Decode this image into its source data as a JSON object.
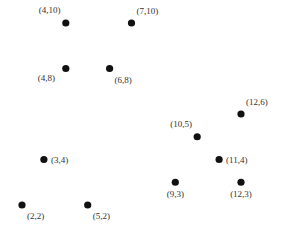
{
  "chart_data": {
    "type": "scatter",
    "title": "",
    "xlabel": "",
    "ylabel": "",
    "axes_visible": false,
    "grid": false,
    "legend": "none",
    "xlim": [
      2,
      12
    ],
    "ylim": [
      2,
      10
    ],
    "marker_color": "#111111",
    "points": [
      {
        "x": 4,
        "y": 10,
        "label": "(4,10)",
        "label_pos": "above-left"
      },
      {
        "x": 7,
        "y": 10,
        "label": "(7,10)",
        "label_pos": "above-right"
      },
      {
        "x": 4,
        "y": 8,
        "label": "(4,8)",
        "label_pos": "below-left"
      },
      {
        "x": 6,
        "y": 8,
        "label": "(6,8)",
        "label_pos": "below-right"
      },
      {
        "x": 3,
        "y": 4,
        "label": "(3,4)",
        "label_pos": "right"
      },
      {
        "x": 2,
        "y": 2,
        "label": "(2,2)",
        "label_pos": "below-right"
      },
      {
        "x": 5,
        "y": 2,
        "label": "(5,2)",
        "label_pos": "below-right"
      },
      {
        "x": 12,
        "y": 6,
        "label": "(12,6)",
        "label_pos": "above-right"
      },
      {
        "x": 10,
        "y": 5,
        "label": "(10,5)",
        "label_pos": "above-left"
      },
      {
        "x": 11,
        "y": 4,
        "label": "(11,4)",
        "label_pos": "right"
      },
      {
        "x": 9,
        "y": 3,
        "label": "(9,3)",
        "label_pos": "below"
      },
      {
        "x": 12,
        "y": 3,
        "label": "(12,3)",
        "label_pos": "below"
      }
    ]
  }
}
